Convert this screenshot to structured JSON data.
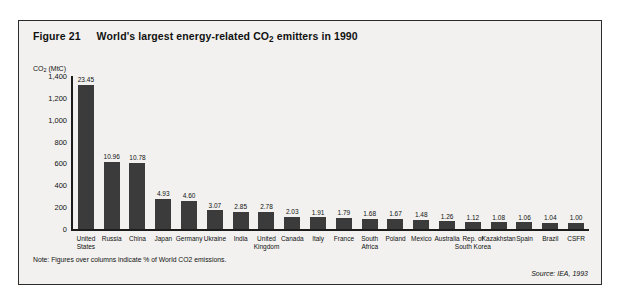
{
  "figure": {
    "number": "Figure 21",
    "note": "Note: Figures over columns indicate % of World CO2 emissions.",
    "source": "Source: IEA, 1993"
  },
  "chart_data": {
    "type": "bar",
    "title": "World's largest energy-related CO2 emitters in 1990",
    "xlabel": "",
    "ylabel": "CO₂ (MtC)",
    "ylim": [
      0,
      1400
    ],
    "yticks": [
      "0",
      "200",
      "400",
      "600",
      "800",
      "1,000",
      "1,200",
      "1,400"
    ],
    "ytick_values": [
      0,
      200,
      400,
      600,
      800,
      1000,
      1200,
      1400
    ],
    "grid": false,
    "legend": "none",
    "annotation": "Figures over columns indicate % of World CO2 emissions.",
    "categories": [
      "United States",
      "Russia",
      "China",
      "Japan",
      "Germany",
      "Ukraine",
      "India",
      "United Kingdom",
      "Canada",
      "Italy",
      "France",
      "South Africa",
      "Poland",
      "Mexico",
      "Australia",
      "Rep. of South Korea",
      "Kazakhstan",
      "Spain",
      "Brazil",
      "CSFR"
    ],
    "series": [
      {
        "name": "CO2 emissions (MtC)",
        "values": [
          1320,
          617,
          607,
          278,
          259,
          173,
          160,
          157,
          114,
          108,
          101,
          95,
          94,
          83,
          71,
          63,
          61,
          60,
          59,
          56
        ]
      },
      {
        "name": "% of World CO2 emissions",
        "values": [
          23.45,
          10.96,
          10.78,
          4.93,
          4.6,
          3.07,
          2.85,
          2.78,
          2.03,
          1.91,
          1.79,
          1.68,
          1.67,
          1.48,
          1.26,
          1.12,
          1.08,
          1.06,
          1.04,
          1.0
        ]
      }
    ],
    "bar_labels": [
      "23.45",
      "10.96",
      "10.78",
      "4.93",
      "4.60",
      "3.07",
      "2.85",
      "2.78",
      "2.03",
      "1.91",
      "1.79",
      "1.68",
      "1.67",
      "1.48",
      "1.26",
      "1.12",
      "1.08",
      "1.06",
      "1.04",
      "1.00"
    ],
    "category_lines": [
      [
        "United",
        "States"
      ],
      [
        "Russia"
      ],
      [
        "China"
      ],
      [
        "Japan"
      ],
      [
        "Germany"
      ],
      [
        "Ukraine"
      ],
      [
        "India"
      ],
      [
        "United",
        "Kingdom"
      ],
      [
        "Canada"
      ],
      [
        "Italy"
      ],
      [
        "France"
      ],
      [
        "South",
        "Africa"
      ],
      [
        "Poland"
      ],
      [
        "Mexico"
      ],
      [
        "Australia"
      ],
      [
        "Rep. of",
        "South Korea"
      ],
      [
        "Kazakhstan"
      ],
      [
        "Spain"
      ],
      [
        "Brazil"
      ],
      [
        "CSFR"
      ]
    ],
    "bar_color": "#3b3b3b",
    "axis_color": "#1c1c1c",
    "background_color": "#f2f1ef"
  }
}
